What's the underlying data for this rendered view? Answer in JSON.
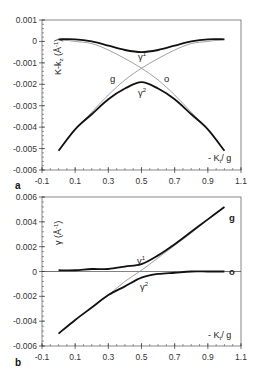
{
  "chart_data": [
    {
      "panel": "a",
      "type": "line",
      "ylabel": "K-k_z (Å^-1)",
      "xlabel": "- K_t / g",
      "xlim": [
        -0.1,
        1.1
      ],
      "ylim": [
        -0.006,
        0.001
      ],
      "x_ticks": [
        "-0.1",
        "0.1",
        "0.3",
        "0.5",
        "0.7",
        "0.9",
        "1.1"
      ],
      "y_ticks": [
        "0.001",
        "0",
        "-0.001",
        "-0.002",
        "-0.003",
        "-0.004",
        "-0.005",
        "-0.006"
      ],
      "grid": false,
      "legend": "inline labels",
      "annotations": [
        "g",
        "o",
        "γ1",
        "γ2"
      ],
      "x": [
        0,
        0.1,
        0.2,
        0.3,
        0.4,
        0.5,
        0.6,
        0.7,
        0.8,
        0.9,
        1.0
      ],
      "series": [
        {
          "name": "g (uncoupled)",
          "style": "thin",
          "values": [
            -0.0051,
            -0.0041,
            -0.0033,
            -0.0025,
            -0.0018,
            -0.00125,
            -0.0008,
            -0.0004,
            -0.0001,
            0.0,
            0.0001
          ]
        },
        {
          "name": "o (uncoupled)",
          "style": "thin",
          "values": [
            0.0001,
            0.0,
            -0.0001,
            -0.0004,
            -0.0008,
            -0.00125,
            -0.0018,
            -0.0025,
            -0.0033,
            -0.0041,
            -0.0051
          ]
        },
        {
          "name": "γ1",
          "style": "thick",
          "values": [
            0.0001,
            0.0001,
            0.0,
            -0.0002,
            -0.0004,
            -0.0005,
            -0.0004,
            -0.0002,
            0.0,
            0.0001,
            0.0001
          ]
        },
        {
          "name": "γ2",
          "style": "thick",
          "values": [
            -0.0051,
            -0.0041,
            -0.0034,
            -0.0027,
            -0.0022,
            -0.0019,
            -0.0022,
            -0.0027,
            -0.0034,
            -0.0041,
            -0.0051
          ]
        }
      ]
    },
    {
      "panel": "b",
      "type": "line",
      "ylabel": "γ (Å^-1)",
      "xlabel": "- K_t / g",
      "xlim": [
        -0.1,
        1.1
      ],
      "ylim": [
        -0.006,
        0.006
      ],
      "x_ticks": [
        "-0.1",
        "0.1",
        "0.3",
        "0.5",
        "0.7",
        "0.9",
        "1.1"
      ],
      "y_ticks": [
        "0.006",
        "0.004",
        "0.002",
        "0",
        "-0.002",
        "-0.004",
        "-0.006"
      ],
      "grid": false,
      "legend": "inline labels",
      "annotations": [
        "g",
        "o",
        "γ1",
        "γ2"
      ],
      "x": [
        0,
        0.1,
        0.2,
        0.3,
        0.4,
        0.5,
        0.6,
        0.7,
        0.8,
        0.9,
        1.0
      ],
      "series": [
        {
          "name": "g (uncoupled)",
          "style": "thin",
          "values": [
            -0.005,
            -0.0039,
            -0.0029,
            -0.0019,
            -0.0008,
            0.0001,
            0.0011,
            0.0021,
            0.0031,
            0.0042,
            0.0052
          ]
        },
        {
          "name": "o (uncoupled)",
          "style": "thin",
          "values": [
            0,
            0,
            0,
            0,
            0,
            0,
            0,
            0,
            0,
            0,
            0
          ]
        },
        {
          "name": "γ1",
          "style": "thick",
          "values": [
            0.0001,
            0.0001,
            0.0002,
            0.0002,
            0.0004,
            0.0006,
            0.0013,
            0.0022,
            0.0032,
            0.0042,
            0.0052
          ]
        },
        {
          "name": "γ2",
          "style": "thick",
          "values": [
            -0.005,
            -0.0039,
            -0.0029,
            -0.0019,
            -0.0012,
            -0.0005,
            -0.0002,
            -0.0001,
            0.0,
            0.0,
            0.0
          ]
        }
      ]
    }
  ],
  "figure": {
    "panel_a": {
      "label": "a",
      "ylabel_main": "K-k",
      "ylabel_sub": "z",
      "ylabel_unit": "(Å",
      "ylabel_exp": "-1",
      "ylabel_close": ")",
      "xlabel_main": "- K",
      "xlabel_sub": "t",
      "xlabel_rest": "/ g",
      "labels": {
        "g": "g",
        "o": "o",
        "gamma1": "γ",
        "gamma1_sup": "1",
        "gamma2": "γ",
        "gamma2_sup": "2"
      }
    },
    "panel_b": {
      "label": "b",
      "ylabel_main": "γ",
      "ylabel_unit": "(Å",
      "ylabel_exp": "-1",
      "ylabel_close": ")",
      "xlabel_main": "- K",
      "xlabel_sub": "t",
      "xlabel_rest": "/ g",
      "labels": {
        "g": "g",
        "o": "o",
        "gamma1": "γ",
        "gamma1_sup": "1",
        "gamma2": "γ",
        "gamma2_sup": "2"
      }
    },
    "colors": {
      "thick_curve": "#111111",
      "thin_curve": "#888888",
      "axis": "#333333"
    }
  }
}
